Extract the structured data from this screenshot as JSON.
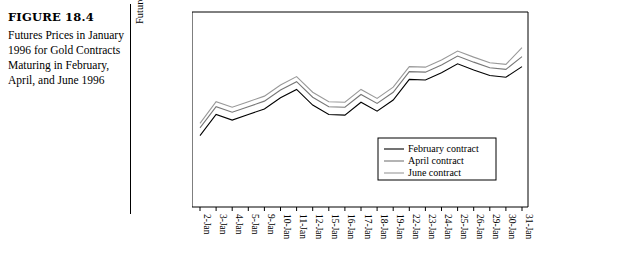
{
  "caption": {
    "figure_label": "FIGURE 18.4",
    "description": "Futures Prices in January 1996 for Gold Contracts Maturing in February, April, and June 1996"
  },
  "chart_data": {
    "type": "line",
    "title": "",
    "xlabel": "",
    "ylabel": "Futures price ($/ounce)",
    "ylim": [
      380.0,
      415.0
    ],
    "yticks": [
      "380.00",
      "385.00",
      "390.00",
      "395.00",
      "400.00",
      "405.00",
      "410.00",
      "415.00"
    ],
    "grid": false,
    "legend_position": "bottom-right",
    "categories": [
      "2-Jan",
      "3-Jan",
      "4-Jan",
      "5-Jan",
      "9-Jan",
      "10-Jan",
      "11-Jan",
      "12-Jan",
      "15-Jan",
      "16-Jan",
      "17-Jan",
      "18-Jan",
      "19-Jan",
      "22-Jan",
      "23-Jan",
      "24-Jan",
      "25-Jan",
      "26-Jan",
      "29-Jan",
      "30-Jan",
      "31-Jan"
    ],
    "series": [
      {
        "name": "February contract",
        "color": "#000000",
        "values": [
          392.8,
          396.6,
          395.6,
          396.6,
          397.6,
          399.6,
          401.1,
          398.3,
          396.6,
          396.5,
          398.8,
          397.2,
          399.2,
          402.9,
          402.8,
          404.1,
          405.7,
          404.6,
          403.6,
          403.3,
          405.2
        ]
      },
      {
        "name": "April contract",
        "color": "#777777",
        "values": [
          394.2,
          398.0,
          397.0,
          398.0,
          399.0,
          401.0,
          402.5,
          399.7,
          398.0,
          397.9,
          400.2,
          398.6,
          400.6,
          404.3,
          404.2,
          405.5,
          407.1,
          406.0,
          405.0,
          404.7,
          407.0
        ]
      },
      {
        "name": "June contract",
        "color": "#999999",
        "values": [
          395.0,
          398.9,
          397.9,
          398.9,
          399.9,
          401.9,
          403.4,
          400.6,
          398.9,
          398.8,
          401.1,
          399.5,
          401.5,
          405.2,
          405.1,
          406.4,
          408.0,
          406.9,
          405.9,
          405.6,
          408.6
        ]
      }
    ]
  }
}
